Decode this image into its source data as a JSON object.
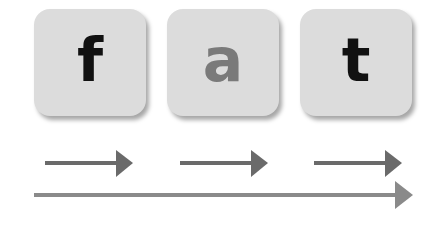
{
  "tiles": [
    {
      "letter": "f",
      "color": "#111111"
    },
    {
      "letter": "a",
      "color": "#7a7a7a"
    },
    {
      "letter": "t",
      "color": "#111111"
    }
  ],
  "arrows": {
    "short_color": "#6a6a6a",
    "long_color": "#8a8a8a"
  }
}
